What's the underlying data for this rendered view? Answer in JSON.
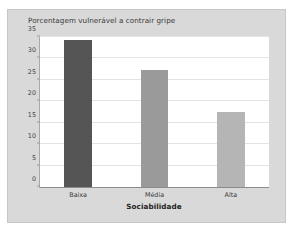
{
  "top_caption": "",
  "chart_data": {
    "type": "bar",
    "title": "Porcentagem vulnerável a contrair gripe",
    "xlabel": "Sociabilidade",
    "ylabel": "",
    "categories": [
      "Baixa",
      "Média",
      "Alta"
    ],
    "values": [
      34.3,
      27.3,
      17.5
    ],
    "bar_colors": [
      "#555555",
      "#9a9a9a",
      "#b5b5b5"
    ],
    "ylim": [
      0,
      35
    ],
    "yticks": [
      0,
      5,
      10,
      15,
      20,
      25,
      30,
      35
    ],
    "ytick_labels": [
      "0",
      "5",
      "10",
      "15",
      "20",
      "25",
      "30",
      "35"
    ],
    "grid": true,
    "legend": false,
    "panel_color": "#d9d9d9",
    "plot_bg": "#ffffff"
  }
}
